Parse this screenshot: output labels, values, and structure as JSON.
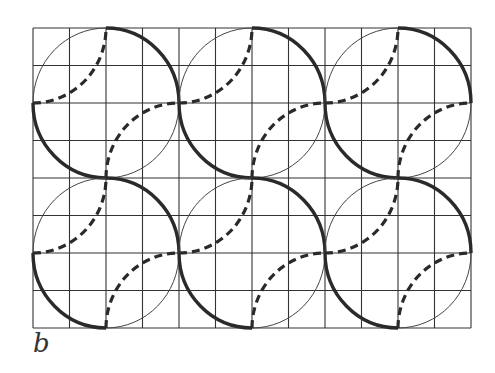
{
  "figure": {
    "label": "b",
    "grid": {
      "left": 33,
      "top": 28,
      "cols": 12,
      "rows": 8,
      "cell_w": 36.5,
      "cell_h": 37.5,
      "color": "#333333"
    },
    "circles": [
      {
        "cx": 106,
        "cy": 103
      },
      {
        "cx": 252,
        "cy": 103
      },
      {
        "cx": 398,
        "cy": 103
      },
      {
        "cx": 106,
        "cy": 253
      },
      {
        "cx": 252,
        "cy": 253
      },
      {
        "cx": 398,
        "cy": 253
      }
    ],
    "radius_x": 73,
    "radius_y": 75,
    "colors": {
      "thin": "#444444",
      "thick": "#2a2a2a",
      "dashed": "#2a2a2a"
    }
  }
}
